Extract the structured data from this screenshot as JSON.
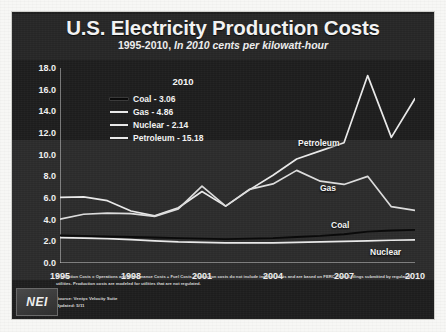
{
  "slide": {
    "title": "U.S. Electricity Production Costs",
    "subtitle_prefix": "1995-2010, ",
    "subtitle_italic": "In 2010 cents per kilowatt-hour",
    "logo_text": "NEI",
    "footnote": "Production Costs = Operations and Maintenance Costs + Fuel Costs. Production costs do not include indirect costs and are based on FERC Form-1 filings submitted by regulated utilities. Production costs are modeled for utilities that are not regulated.",
    "source_line": "Source: Ventyx Velocity Suite",
    "updated_line": "Updated: 5/11"
  },
  "legend": {
    "header": "2010",
    "items": [
      {
        "label": "Coal - 3.06",
        "color": "#0b0b0b"
      },
      {
        "label": "Gas - 4.86",
        "color": "#e8e8e8"
      },
      {
        "label": "Nuclear - 2.14",
        "color": "#e8e8e8"
      },
      {
        "label": "Petroleum - 15.18",
        "color": "#e8e8e8"
      }
    ]
  },
  "series_labels": [
    {
      "name": "Petroleum",
      "x": 286,
      "y": 126
    },
    {
      "name": "Gas",
      "x": 308,
      "y": 171
    },
    {
      "name": "Coal",
      "x": 319,
      "y": 208
    },
    {
      "name": "Nuclear",
      "x": 358,
      "y": 235
    }
  ],
  "chart_data": {
    "type": "line",
    "title": "U.S. Electricity Production Costs",
    "subtitle": "1995-2010, In 2010 cents per kilowatt-hour",
    "xlabel": "",
    "ylabel": "2010 cents per kilowatt-hour",
    "xlim": [
      1995,
      2010
    ],
    "ylim": [
      0.0,
      18.0
    ],
    "ytick_values": [
      0.0,
      2.0,
      4.0,
      6.0,
      8.0,
      10.0,
      12.0,
      14.0,
      16.0,
      18.0
    ],
    "ytick_labels": [
      "0.0",
      "2.0",
      "4.0",
      "6.0",
      "8.0",
      "10.0",
      "12.0",
      "14.0",
      "16.0",
      "18.0"
    ],
    "xtick_values": [
      1995,
      1998,
      2001,
      2004,
      2007,
      2010
    ],
    "xtick_labels": [
      "1995",
      "1998",
      "2001",
      "2004",
      "2007",
      "2010"
    ],
    "minor_xticks": [
      1995,
      1996,
      1997,
      1998,
      1999,
      2000,
      2001,
      2002,
      2003,
      2004,
      2005,
      2006,
      2007,
      2008,
      2009,
      2010
    ],
    "grid": false,
    "legend_position": "upper-left-inset",
    "x": [
      1995,
      1996,
      1997,
      1998,
      1999,
      2000,
      2001,
      2002,
      2003,
      2004,
      2005,
      2006,
      2007,
      2008,
      2009,
      2010
    ],
    "series": [
      {
        "name": "Petroleum",
        "color": "#e9e9e9",
        "values": [
          6.05,
          6.1,
          5.75,
          4.8,
          4.35,
          5.1,
          6.6,
          5.25,
          6.75,
          8.1,
          9.6,
          10.35,
          11.1,
          17.3,
          11.6,
          15.18
        ]
      },
      {
        "name": "Gas",
        "color": "#dcdcdc",
        "values": [
          4.05,
          4.5,
          4.6,
          4.55,
          4.3,
          5.0,
          7.1,
          5.25,
          6.8,
          7.3,
          8.55,
          7.55,
          7.25,
          8.0,
          5.2,
          4.86
        ]
      },
      {
        "name": "Coal",
        "color": "#0a0a0a",
        "values": [
          2.55,
          2.5,
          2.45,
          2.4,
          2.35,
          2.3,
          2.25,
          2.2,
          2.25,
          2.3,
          2.4,
          2.5,
          2.65,
          2.9,
          3.0,
          3.06
        ]
      },
      {
        "name": "Nuclear",
        "color": "#e9e9e9",
        "values": [
          2.35,
          2.3,
          2.25,
          2.15,
          2.05,
          1.95,
          1.9,
          1.85,
          1.85,
          1.85,
          1.9,
          1.95,
          2.0,
          2.05,
          2.1,
          2.14
        ]
      }
    ]
  }
}
